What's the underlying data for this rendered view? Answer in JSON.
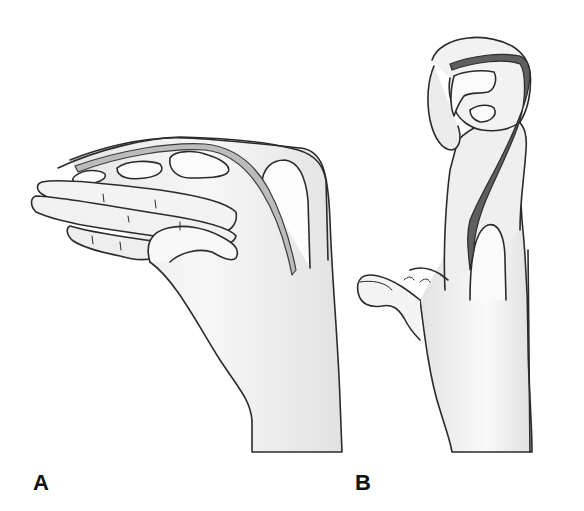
{
  "figure": {
    "panels": [
      {
        "label": "A",
        "description": "Hand in lateral view with fingers flexed, showing flexor tendon path along the dorsum"
      },
      {
        "label": "B",
        "description": "Hand viewed from side with finger flexed tightly over, tendon shown in dark shading, thumb extended"
      }
    ],
    "caption_partial": "",
    "colors": {
      "outline": "#2b2b2b",
      "skin_shade": "#d9d9d9",
      "tendon_light": "#b5b5b5",
      "tendon_dark": "#5a5a5a",
      "background": "#ffffff"
    }
  }
}
